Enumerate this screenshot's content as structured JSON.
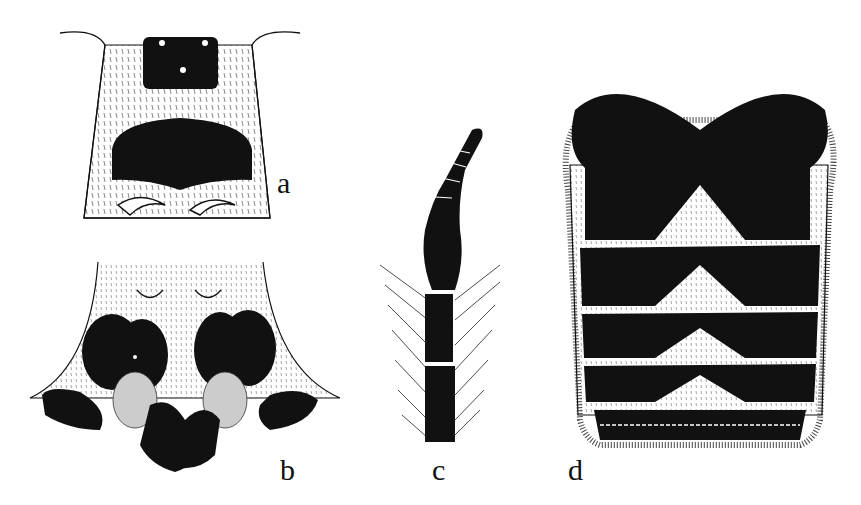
{
  "figure": {
    "panels": [
      {
        "id": "a",
        "label": "a",
        "subject": "head-frontal-view"
      },
      {
        "id": "b",
        "label": "b",
        "subject": "head-ventral-view-mouthparts"
      },
      {
        "id": "c",
        "label": "c",
        "subject": "antenna"
      },
      {
        "id": "d",
        "label": "d",
        "subject": "abdomen-dorsal-view"
      }
    ],
    "colors": {
      "ink": "#111111",
      "paper": "#ffffff",
      "stipple": "#555555"
    }
  }
}
